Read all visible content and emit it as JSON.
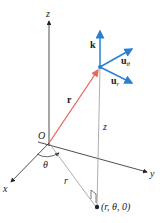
{
  "diagram": {
    "axes": {
      "x_label": "x",
      "y_label": "y",
      "z_label": "z"
    },
    "origin_label": "O",
    "position_vector_label": "r",
    "angle_label": "θ",
    "radial_distance_label": "r",
    "height_label": "z",
    "projection_point_label": "(r, θ, 0)",
    "unit_vectors": {
      "k": "k",
      "u_theta": "u",
      "u_theta_sub": "θ",
      "u_r": "u",
      "u_r_sub": "r"
    },
    "colors": {
      "position_vector": "#e8675a",
      "unit_vectors": "#2a7fd4",
      "axes": "#222222",
      "construction": "#999999"
    }
  }
}
